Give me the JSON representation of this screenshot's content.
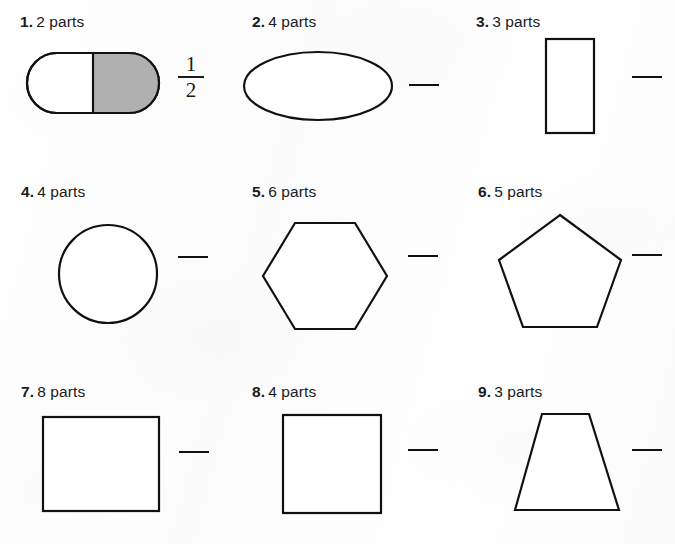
{
  "worksheet": {
    "background_color": "#fdfdfd",
    "ink_color": "#1a1a1a",
    "shaded_fill_color": "#b0b0b0",
    "problems": [
      {
        "number": "1.",
        "parts": "2 parts",
        "shape": "rounded-rectangle",
        "divisions": 2,
        "shaded_parts": 1,
        "answer": {
          "type": "fraction",
          "numerator": "1",
          "denominator": "2"
        }
      },
      {
        "number": "2.",
        "parts": "4 parts",
        "shape": "ellipse",
        "divisions": 4,
        "shaded_parts": 0,
        "answer": {
          "type": "blank",
          "value": ""
        }
      },
      {
        "number": "3.",
        "parts": "3 parts",
        "shape": "rectangle-vertical",
        "divisions": 3,
        "shaded_parts": 0,
        "answer": {
          "type": "blank",
          "value": ""
        }
      },
      {
        "number": "4.",
        "parts": "4 parts",
        "shape": "circle",
        "divisions": 4,
        "shaded_parts": 0,
        "answer": {
          "type": "blank",
          "value": ""
        }
      },
      {
        "number": "5.",
        "parts": "6 parts",
        "shape": "hexagon",
        "divisions": 6,
        "shaded_parts": 0,
        "answer": {
          "type": "blank",
          "value": ""
        }
      },
      {
        "number": "6.",
        "parts": "5 parts",
        "shape": "pentagon",
        "divisions": 5,
        "shaded_parts": 0,
        "answer": {
          "type": "blank",
          "value": ""
        }
      },
      {
        "number": "7.",
        "parts": "8 parts",
        "shape": "rectangle-horizontal",
        "divisions": 8,
        "shaded_parts": 0,
        "answer": {
          "type": "blank",
          "value": ""
        }
      },
      {
        "number": "8.",
        "parts": "4 parts",
        "shape": "square",
        "divisions": 4,
        "shaded_parts": 0,
        "answer": {
          "type": "blank",
          "value": ""
        }
      },
      {
        "number": "9.",
        "parts": "3 parts",
        "shape": "trapezoid",
        "divisions": 3,
        "shaded_parts": 0,
        "answer": {
          "type": "blank",
          "value": ""
        }
      }
    ]
  }
}
